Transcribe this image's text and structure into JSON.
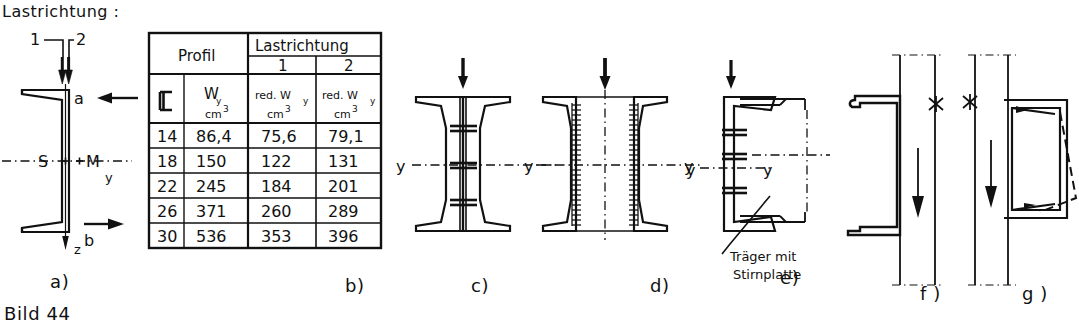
{
  "figure": {
    "caption": "Bild 44",
    "panel_labels": {
      "a": "a)",
      "b": "b)",
      "c": "c)",
      "d": "d)",
      "e": "e)",
      "f": "f )",
      "g": "g )"
    }
  },
  "panel_a": {
    "title": "Lastrichtung :",
    "load_case_1": "1",
    "load_case_2": "2",
    "point_a": "a",
    "point_b": "b",
    "shear_center": "S",
    "centroid": "M",
    "axis_y": "y",
    "axis_z": "z"
  },
  "table": {
    "header_profil": "Profil",
    "header_lastrichtung": "Lastrichtung",
    "header_dir_1": "1",
    "header_dir_2": "2",
    "sub_profile_symbol": "⌐",
    "sub_wy": "W",
    "sub_wy_index": "y",
    "sub_unit": "cm",
    "sub_unit_exp": "3",
    "sub_red_wy": "red. W",
    "rows": [
      {
        "profil": "14",
        "wy": "86,4",
        "red_wy_1": "75,6",
        "red_wy_2": "79,1"
      },
      {
        "profil": "18",
        "wy": "150",
        "red_wy_1": "122",
        "red_wy_2": "131"
      },
      {
        "profil": "22",
        "wy": "245",
        "red_wy_1": "184",
        "red_wy_2": "201"
      },
      {
        "profil": "26",
        "wy": "371",
        "red_wy_1": "260",
        "red_wy_2": "289"
      },
      {
        "profil": "30",
        "wy": "536",
        "red_wy_1": "353",
        "red_wy_2": "396"
      }
    ]
  },
  "panel_c": {
    "axis_y_left": "y",
    "axis_y_right": "y"
  },
  "panel_d": {
    "axis_y_left": "y"
  },
  "panel_e": {
    "axis_y_left": "y",
    "axis_y_right": "y",
    "annotation_line1": "Träger mit",
    "annotation_line2": "Stirnplatte"
  },
  "colors": {
    "ink": "#111111",
    "paper": "#ffffff"
  }
}
